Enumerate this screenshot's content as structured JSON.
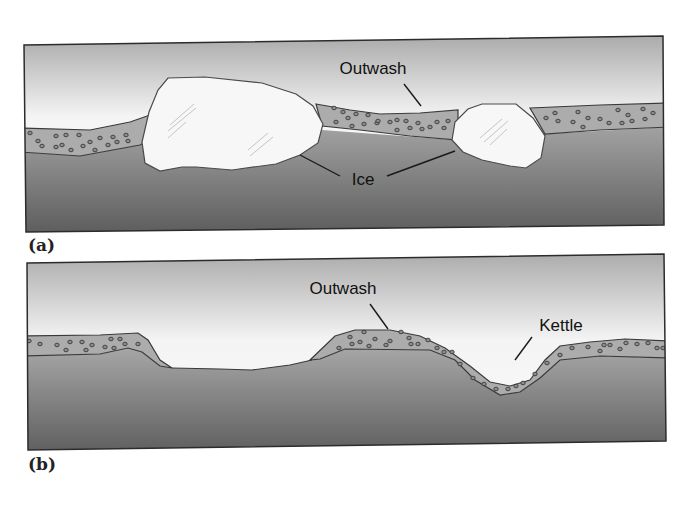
{
  "figure": {
    "panels": [
      {
        "id": "a",
        "label": "(a)",
        "callouts": {
          "outwash": "Outwash",
          "ice": "Ice"
        }
      },
      {
        "id": "b",
        "label": "(b)",
        "callouts": {
          "outwash": "Outwash",
          "kettle": "Kettle"
        }
      }
    ],
    "colors": {
      "sky_top": "#a9a9a9",
      "sky_light": "#f4f4f4",
      "ground_top": "#a4a4a4",
      "ground_bottom": "#595959",
      "outwash_fill": "#acacac",
      "ice_fill": "#f7f7f7",
      "outline": "#3a3a3a"
    }
  }
}
